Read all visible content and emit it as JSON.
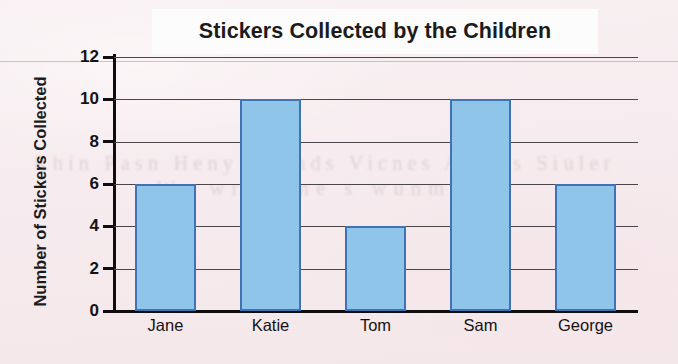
{
  "chart_data": {
    "type": "bar",
    "title": "Stickers Collected by the Children",
    "xlabel": "",
    "ylabel": "Number of Stickers Collected",
    "categories": [
      "Jane",
      "Katie",
      "Tom",
      "Sam",
      "George"
    ],
    "values": [
      6,
      10,
      4,
      10,
      6
    ],
    "ylim": [
      0,
      12
    ],
    "yticks": [
      0,
      2,
      4,
      6,
      8,
      10,
      12
    ],
    "ytick_labels": [
      "0",
      "2",
      "4",
      "6",
      "8",
      "10",
      "12"
    ],
    "grid": true,
    "legend": null,
    "series": [
      {
        "name": "Stickers Collected",
        "values": [
          6,
          10,
          4,
          10,
          6
        ]
      }
    ],
    "colors": {
      "bar_fill": "#8ec5e9",
      "bar_border": "#3f73b5",
      "gridline": "#4b4649",
      "axis": "#100d0e",
      "text": "#151214",
      "page_background": "#f7eef0",
      "title_band": "#fdfcfc"
    }
  },
  "bleed_through": {
    "line1": "Rhin Pasn Heny Snunds Vicnes Aenws Siuler",
    "line2": "We wrnwrne s  wunmrn"
  }
}
